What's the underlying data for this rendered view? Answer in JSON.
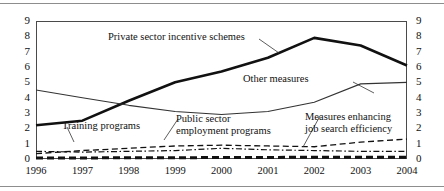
{
  "figure": {
    "name": "active-labour-market-programmes-line-chart",
    "rules": [
      "page-rule-top",
      "page-rule-bottom"
    ]
  },
  "chart_data": {
    "type": "line",
    "title": "",
    "subtitle": "",
    "xlabel": "",
    "ylabel": "",
    "x": [
      1996,
      1997,
      1998,
      1999,
      2000,
      2001,
      2002,
      2003,
      2004
    ],
    "categories": [
      "1996",
      "1997",
      "1998",
      "1999",
      "2000",
      "2001",
      "2002",
      "2003",
      "2004"
    ],
    "xlim": [
      1996,
      2004
    ],
    "ylim": [
      0,
      9
    ],
    "yticks": [
      0,
      1,
      2,
      3,
      4,
      5,
      6,
      7,
      8,
      9
    ],
    "ytick_labels_left": [
      "0",
      "1",
      "2",
      "3",
      "4",
      "5",
      "6",
      "7",
      "8",
      "9"
    ],
    "ytick_labels_right": [
      "0",
      "1",
      "2",
      "3",
      "4",
      "5",
      "6",
      "7",
      "8",
      "9"
    ],
    "grid": false,
    "legend": "inline-annotations",
    "series": [
      {
        "name": "Private sector incentive schemes",
        "style": "thick-solid",
        "color": "#111111",
        "values": [
          2.2,
          2.5,
          3.8,
          5.0,
          5.7,
          6.6,
          7.9,
          7.4,
          6.1
        ]
      },
      {
        "name": "Other measures",
        "style": "thin-solid",
        "color": "#333333",
        "values": [
          4.5,
          4.0,
          3.5,
          3.1,
          2.9,
          3.1,
          3.7,
          4.9,
          5.0
        ]
      },
      {
        "name": "Public sector employment programs",
        "style": "dashed",
        "color": "#111111",
        "values": [
          0.35,
          0.55,
          0.7,
          0.85,
          0.9,
          0.85,
          0.8,
          1.1,
          1.3
        ]
      },
      {
        "name": "Training programs",
        "style": "dash-dot",
        "color": "#111111",
        "values": [
          0.5,
          0.45,
          0.5,
          0.55,
          0.7,
          0.6,
          0.55,
          0.5,
          0.5
        ]
      },
      {
        "name": "Measures enhancing job search efficiency",
        "style": "thick-dashed",
        "color": "#111111",
        "values": [
          0.07,
          0.07,
          0.08,
          0.08,
          0.1,
          0.1,
          0.12,
          0.12,
          0.12
        ]
      }
    ],
    "annotations": [
      {
        "id": "private-sector",
        "text": "Private sector incentive schemes",
        "lines": [
          "Private sector incentive schemes"
        ]
      },
      {
        "id": "other-measures",
        "text": "Other measures",
        "lines": [
          "Other measures"
        ]
      },
      {
        "id": "training-programs",
        "text": "Training programs",
        "lines": [
          "Training programs"
        ]
      },
      {
        "id": "public-sector",
        "text": "Public sector employment programs",
        "lines": [
          "Public sector",
          "employment programs"
        ]
      },
      {
        "id": "job-search",
        "text": "Measures enhancing job search efficiency",
        "lines": [
          "Measures enhancing",
          "job search efficiency"
        ]
      }
    ]
  }
}
